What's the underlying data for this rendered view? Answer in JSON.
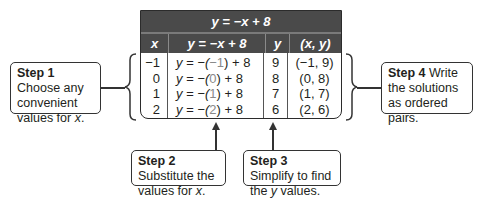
{
  "table": {
    "title": "y = −x + 8",
    "headers": [
      "x",
      "y = −x + 8",
      "y",
      "(x, y)"
    ],
    "rows": [
      {
        "x": "−1",
        "pre": "y = −(",
        "val": "−1",
        "post": ") + 8",
        "y": "9",
        "pair": "(−1, 9)"
      },
      {
        "x": "0",
        "pre": "y = −(",
        "val": "0",
        "post": ") + 8",
        "y": "8",
        "pair": "(0, 8)"
      },
      {
        "x": "1",
        "pre": "y = −(",
        "val": "1",
        "post": ") + 8",
        "y": "7",
        "pair": "(1, 7)"
      },
      {
        "x": "2",
        "pre": "y = −(",
        "val": "2",
        "post": ") + 8",
        "y": "6",
        "pair": "(2, 6)"
      }
    ]
  },
  "steps": [
    {
      "label": "Step 1",
      "text": " Choose any convenient values for ",
      "var": "x",
      "end": "."
    },
    {
      "label": "Step 2",
      "text": " Substitute the values for ",
      "var": "x",
      "end": "."
    },
    {
      "label": "Step 3",
      "text": " Simplify to find the ",
      "var": "y",
      "end": " values."
    },
    {
      "label": "Step 4",
      "text": " Write the solutions as ordered pairs.",
      "var": "",
      "end": ""
    }
  ],
  "colors": {
    "header_bg": "#4a4a4a",
    "border": "#2b2b2b",
    "substituted": "#8a8a8a"
  }
}
